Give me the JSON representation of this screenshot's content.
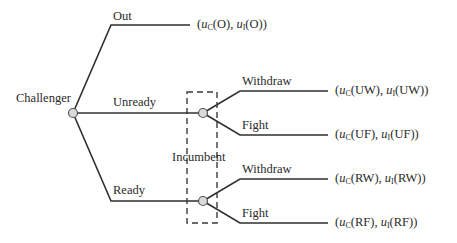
{
  "diagram": {
    "type": "extensive-form game tree",
    "players": {
      "root": "Challenger",
      "second": "Incumbent"
    },
    "actions": {
      "out": "Out",
      "unready": "Unready",
      "ready": "Ready",
      "withdraw_u": "Withdraw",
      "fight_u": "Fight",
      "withdraw_r": "Withdraw",
      "fight_r": "Fight"
    },
    "payoffs": {
      "O": {
        "uc": "u",
        "uc_sub": "C",
        "arg": "O",
        "ui_sub": "I"
      },
      "UW": {
        "arg": "UW"
      },
      "UF": {
        "arg": "UF"
      },
      "RW": {
        "arg": "RW"
      },
      "RF": {
        "arg": "RF"
      }
    },
    "payoff_text": {
      "O": "(uC(O), uI(O))",
      "UW": "(uC(UW), uI(UW))",
      "UF": "(uC(UF), uI(UF))",
      "RW": "(uC(RW), uI(RW))",
      "RF": "(uC(RF), uI(RF))"
    },
    "info_set_label": "Incumbent",
    "colors": {
      "line": "#2f2f2f",
      "node_fill": "#d9d9d9",
      "node_stroke": "#555555"
    }
  }
}
